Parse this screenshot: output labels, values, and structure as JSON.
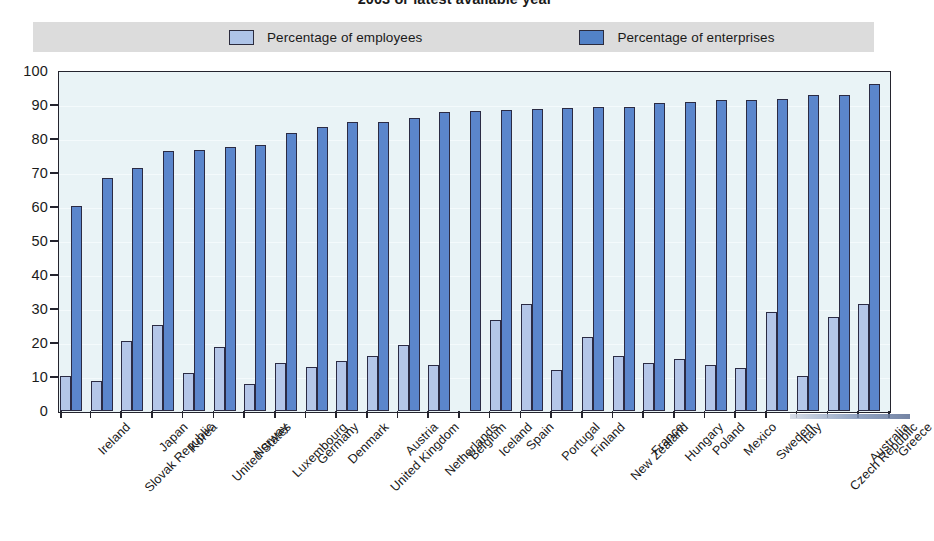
{
  "chart_data": {
    "type": "bar",
    "title": "2003 or latest available year",
    "xlabel": "",
    "ylabel": "",
    "ylim": [
      0,
      100
    ],
    "yticks": [
      0,
      10,
      20,
      30,
      40,
      50,
      60,
      70,
      80,
      90,
      100
    ],
    "grid": true,
    "legend_position": "top",
    "categories": [
      "Ireland",
      "Slovak Republic",
      "Japan",
      "Korea",
      "United States",
      "Norway",
      "Luxembourg",
      "Germany",
      "Denmark",
      "United Kingdom",
      "Austria",
      "Netherlands",
      "Belgium",
      "Iceland",
      "Spain",
      "Portugal",
      "Finland",
      "New Zealand",
      "France",
      "Hungary",
      "Poland",
      "Mexico",
      "Sweden",
      "Italy",
      "Czech Republic",
      "Australia",
      "Greece"
    ],
    "series": [
      {
        "name": "Percentage of employees",
        "color": "#b4c6e8",
        "values": [
          10.2,
          8.8,
          20.6,
          25.4,
          11.2,
          18.8,
          8.0,
          14.2,
          13.0,
          14.8,
          16.2,
          19.3,
          13.5,
          0.0,
          26.8,
          31.4,
          12.2,
          21.8,
          16.2,
          14.0,
          15.4,
          13.5,
          12.7,
          29.2,
          10.4,
          27.6,
          31.5
        ]
      },
      {
        "name": "Percentage of enterprises",
        "color": "#5b86cc",
        "values": [
          60.2,
          68.6,
          71.6,
          76.5,
          76.7,
          77.6,
          78.2,
          81.8,
          83.4,
          85.0,
          85.1,
          86.3,
          87.8,
          88.2,
          88.4,
          88.9,
          89.1,
          89.3,
          89.4,
          90.7,
          90.9,
          91.6,
          91.6,
          91.7,
          92.8,
          92.9,
          96.2
        ]
      }
    ]
  },
  "legend": {
    "entries": [
      {
        "label": "Percentage of employees",
        "color": "#b4c6e8"
      },
      {
        "label": "Percentage of enterprises",
        "color": "#5b86cc"
      }
    ]
  },
  "colors": {
    "plot_background": "#e9f3f6",
    "legend_background": "#dcdcdc",
    "axis": "#24242e",
    "employees": "#b4c6e8",
    "enterprises": "#5b86cc"
  }
}
